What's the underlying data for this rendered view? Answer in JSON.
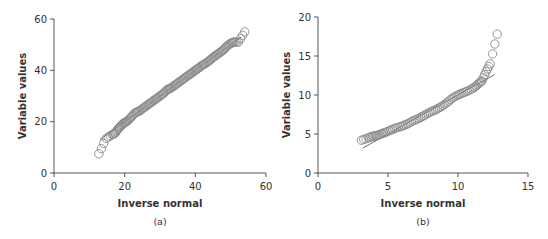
{
  "chart_data": [
    {
      "type": "scatter",
      "panel": "(a)",
      "title": "",
      "xlabel": "Inverse normal",
      "ylabel": "Variable values",
      "xlim": [
        0,
        60
      ],
      "ylim": [
        0,
        60
      ],
      "xticks": [
        0,
        20,
        40,
        60
      ],
      "yticks": [
        0,
        20,
        40,
        60
      ],
      "grid": false,
      "marker": "open-circle",
      "reference_line": {
        "x": [
          13,
          53
        ],
        "y": [
          13,
          53
        ]
      },
      "points": [
        [
          12.7,
          7.5
        ],
        [
          14.8,
          13.5
        ],
        [
          16.5,
          15
        ],
        [
          17.3,
          15.5
        ],
        [
          18,
          17
        ],
        [
          18.8,
          18.2
        ],
        [
          19.5,
          19.2
        ],
        [
          20.2,
          19.8
        ],
        [
          21,
          20.5
        ],
        [
          22,
          22
        ],
        [
          23,
          23.5
        ],
        [
          24,
          24
        ],
        [
          25,
          25
        ],
        [
          26,
          26
        ],
        [
          27,
          27
        ],
        [
          28,
          28
        ],
        [
          29,
          29
        ],
        [
          30,
          30
        ],
        [
          31,
          31
        ],
        [
          32,
          32.5
        ],
        [
          33,
          33
        ],
        [
          34,
          34
        ],
        [
          35,
          35
        ],
        [
          36,
          36
        ],
        [
          37,
          37
        ],
        [
          38,
          38
        ],
        [
          39,
          39
        ],
        [
          40,
          40
        ],
        [
          41,
          41
        ],
        [
          42,
          42
        ],
        [
          43,
          42.8
        ],
        [
          44,
          43.8
        ],
        [
          45,
          45
        ],
        [
          46,
          46
        ],
        [
          47,
          47
        ],
        [
          48,
          48
        ],
        [
          49,
          49.5
        ],
        [
          50,
          50.5
        ],
        [
          50.8,
          51
        ],
        [
          52.2,
          51
        ],
        [
          54,
          55
        ]
      ]
    },
    {
      "type": "scatter",
      "panel": "(b)",
      "title": "",
      "xlabel": "Inverse normal",
      "ylabel": "Variable values",
      "xlim": [
        0,
        15
      ],
      "ylim": [
        0,
        20
      ],
      "xticks": [
        0,
        5,
        10,
        15
      ],
      "yticks": [
        0,
        5,
        10,
        15,
        20
      ],
      "grid": false,
      "marker": "open-circle",
      "reference_line": {
        "x": [
          3.2,
          12.6
        ],
        "y": [
          3.2,
          12.6
        ]
      },
      "points": [
        [
          3.1,
          4.2
        ],
        [
          3.6,
          4.5
        ],
        [
          3.9,
          4.7
        ],
        [
          4.2,
          4.8
        ],
        [
          4.5,
          5.0
        ],
        [
          4.8,
          5.2
        ],
        [
          5.2,
          5.5
        ],
        [
          5.6,
          5.8
        ],
        [
          6.0,
          6.0
        ],
        [
          6.4,
          6.3
        ],
        [
          6.8,
          6.7
        ],
        [
          7.2,
          7.0
        ],
        [
          7.6,
          7.4
        ],
        [
          8.0,
          7.8
        ],
        [
          8.4,
          8.1
        ],
        [
          8.8,
          8.5
        ],
        [
          9.2,
          9.0
        ],
        [
          9.6,
          9.6
        ],
        [
          10.0,
          10.0
        ],
        [
          10.4,
          10.3
        ],
        [
          10.8,
          10.6
        ],
        [
          11.2,
          11.0
        ],
        [
          11.5,
          11.5
        ],
        [
          11.7,
          11.8
        ],
        [
          12.0,
          13.0
        ],
        [
          12.3,
          14.0
        ],
        [
          12.8,
          17.8
        ]
      ]
    }
  ],
  "panels": [
    {
      "caption": "(a)",
      "xlabel": "Inverse normal",
      "ylabel": "Variable values",
      "xticks": [
        "0",
        "20",
        "40",
        "60"
      ],
      "yticks": [
        "0",
        "20",
        "40",
        "60"
      ]
    },
    {
      "caption": "(b)",
      "xlabel": "Inverse normal",
      "ylabel": "Variable values",
      "xticks": [
        "0",
        "5",
        "10",
        "15"
      ],
      "yticks": [
        "0",
        "5",
        "10",
        "15",
        "20"
      ]
    }
  ],
  "colors": {
    "axis": "#555555",
    "marker": "#8a8a8a",
    "line": "#666666",
    "text": "#333333"
  }
}
